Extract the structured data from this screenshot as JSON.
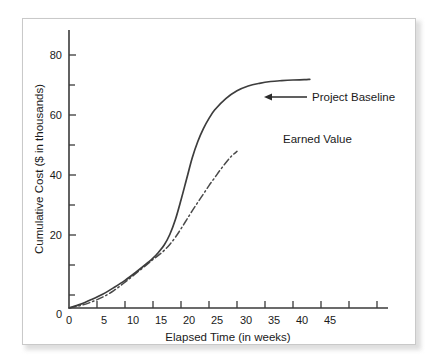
{
  "chart_data": {
    "type": "line",
    "title": "",
    "xlabel": "Elapsed Time (in weeks)",
    "ylabel": "Cumulative Cost ($ in thousands)",
    "xlim": [
      0,
      47
    ],
    "ylim": [
      0,
      87
    ],
    "xticks": [
      0,
      5,
      10,
      15,
      20,
      25,
      30,
      35,
      40,
      45
    ],
    "xtick_labels": [
      "0",
      "5",
      "10",
      "15",
      "20",
      "25",
      "30",
      "35",
      "40",
      "45"
    ],
    "yticks": [
      0,
      10,
      20,
      30,
      40,
      50,
      60,
      70,
      80
    ],
    "ytick_labels": [
      "0",
      "",
      "20",
      "",
      "40",
      "",
      "60",
      "",
      "80"
    ],
    "grid": false,
    "legend_position": "inline-annotation",
    "series": [
      {
        "name": "Project Baseline",
        "style": "solid",
        "color": "#3d3d3d",
        "x": [
          0,
          2,
          4,
          6,
          8,
          10,
          12,
          14,
          15,
          16,
          17,
          18,
          19,
          20,
          21,
          22,
          23,
          24,
          25,
          26,
          28,
          30,
          32,
          34,
          36,
          38,
          40,
          42,
          43
        ],
        "y": [
          0,
          1.2,
          2.8,
          4.6,
          6.8,
          9.2,
          12.0,
          15.0,
          16.6,
          18.6,
          21.0,
          24.5,
          29.5,
          36.0,
          43.0,
          50.0,
          55.5,
          59.8,
          63.2,
          66.0,
          69.8,
          72.4,
          74.0,
          74.9,
          75.5,
          75.8,
          76.0,
          76.1,
          76.2
        ]
      },
      {
        "name": "Earned Value",
        "style": "dash-dot",
        "color": "#4a4a4a",
        "x": [
          0,
          2,
          4,
          6,
          8,
          10,
          12,
          14,
          15,
          16,
          17,
          18,
          19,
          20,
          21,
          22,
          23,
          24,
          25,
          26,
          27,
          28,
          29,
          30
        ],
        "y": [
          0,
          0.8,
          2.0,
          3.6,
          5.8,
          8.6,
          11.6,
          14.6,
          16.2,
          17.6,
          19.2,
          21.2,
          23.6,
          26.4,
          29.4,
          32.4,
          35.2,
          38.0,
          40.8,
          43.4,
          46.0,
          48.4,
          50.6,
          52.2
        ]
      }
    ],
    "annotations": [
      {
        "text": "Project Baseline",
        "target_x": 23.8,
        "target_y": 61.0,
        "has_arrow": true
      },
      {
        "text": "Earned Value",
        "target_x": 29.5,
        "target_y": 51.0,
        "has_arrow": false
      }
    ]
  },
  "axes": {
    "x_title": "Elapsed Time (in weeks)",
    "y_title": "Cumulative Cost ($ in thousands)",
    "x_tick_labels": [
      "0",
      "5",
      "10",
      "15",
      "20",
      "25",
      "30",
      "35",
      "40",
      "45"
    ],
    "y_tick_labels": [
      "20",
      "40",
      "60",
      "80"
    ],
    "y_origin_label": "0"
  },
  "annotations": {
    "baseline_label": "Project Baseline",
    "earned_value_label": "Earned Value"
  },
  "colors": {
    "baseline": "#3d3d3d",
    "earned_value": "#4a4a4a",
    "axis": "#3a3a3a",
    "frame_border": "#c9c9c9",
    "background": "#ffffff"
  }
}
